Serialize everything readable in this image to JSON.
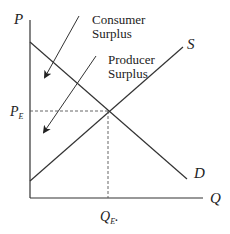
{
  "diagram": {
    "axes": {
      "y_label": "P",
      "x_label": "Q"
    },
    "curves": {
      "supply_label": "S",
      "demand_label": "D"
    },
    "equilibrium": {
      "price_label": "P",
      "price_sub": "E",
      "quantity_label": "Q",
      "quantity_sub": "E",
      "quantity_suffix": "."
    },
    "annotations": {
      "consumer_line1": "Consumer",
      "consumer_line2": "Surplus",
      "producer_line1": "Producer",
      "producer_line2": "Surplus"
    },
    "colors": {
      "line": "#333333",
      "background": "#ffffff"
    }
  }
}
